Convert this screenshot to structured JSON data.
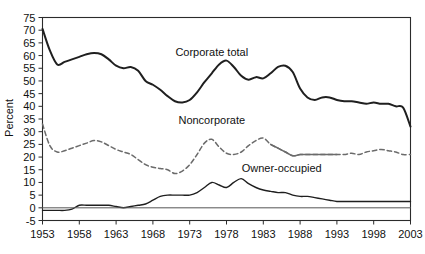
{
  "chart_data": {
    "type": "line",
    "title": "",
    "xlabel": "",
    "ylabel": "Percent",
    "xlim": [
      1953,
      2003
    ],
    "ylim": [
      -5,
      75
    ],
    "ytick_step": 5,
    "xtick_step": 5,
    "grid": false,
    "legend_position": "inline-annotations",
    "xticks": [
      "1953",
      "1958",
      "1963",
      "1968",
      "1973",
      "1978",
      "1983",
      "1988",
      "1993",
      "1998",
      "2003"
    ],
    "yticks": [
      "-5",
      "0",
      "5",
      "10",
      "15",
      "20",
      "25",
      "30",
      "35",
      "40",
      "45",
      "50",
      "55",
      "60",
      "65",
      "70",
      "75"
    ],
    "annotations": [
      {
        "text": "Corporate total",
        "x": 1976.0,
        "y": 60.0
      },
      {
        "text": "Noncorporate",
        "x": 1976.0,
        "y": 33.0
      },
      {
        "text": "Owner-occupied",
        "x": 1985.5,
        "y": 14.0
      }
    ],
    "series": [
      {
        "name": "Corporate total",
        "style": "solid",
        "color": "#1f1f1f",
        "width": 2.0,
        "x": [
          1953,
          1954,
          1955,
          1956,
          1957,
          1958,
          1959,
          1960,
          1961,
          1962,
          1963,
          1964,
          1965,
          1966,
          1967,
          1968,
          1969,
          1970,
          1971,
          1972,
          1973,
          1974,
          1975,
          1976,
          1977,
          1978,
          1979,
          1980,
          1981,
          1982,
          1983,
          1984,
          1985,
          1986,
          1987,
          1988,
          1989,
          1990,
          1991,
          1992,
          1993,
          1994,
          1995,
          1996,
          1997,
          1998,
          1999,
          2000,
          2001,
          2002,
          2003
        ],
        "values": [
          70.5,
          62.0,
          56.5,
          57.5,
          58.5,
          59.5,
          60.5,
          61.0,
          60.5,
          58.5,
          56.0,
          55.0,
          55.5,
          54.0,
          50.0,
          48.5,
          46.5,
          44.0,
          42.0,
          41.5,
          42.5,
          45.5,
          49.5,
          53.0,
          56.5,
          58.0,
          55.5,
          52.0,
          50.5,
          51.5,
          51.0,
          53.0,
          55.5,
          56.0,
          53.5,
          47.0,
          43.5,
          42.5,
          43.5,
          43.5,
          42.5,
          42.0,
          42.0,
          41.5,
          41.0,
          41.5,
          41.0,
          41.0,
          40.0,
          39.5,
          32.0
        ]
      },
      {
        "name": "Noncorporate",
        "style": "dashed",
        "color": "#6b6b6b",
        "width": 1.5,
        "x": [
          1953,
          1954,
          1955,
          1956,
          1957,
          1958,
          1959,
          1960,
          1961,
          1962,
          1963,
          1964,
          1965,
          1966,
          1967,
          1968,
          1969,
          1970,
          1971,
          1972,
          1973,
          1974,
          1975,
          1976,
          1977,
          1978,
          1979,
          1980,
          1981,
          1982,
          1983,
          1984,
          1985,
          1986,
          1987,
          1988,
          1989,
          1990,
          1991,
          1992,
          1993,
          1994,
          1995,
          1996,
          1997,
          1998,
          1999,
          2000,
          2001,
          2002,
          2003
        ],
        "values": [
          33.0,
          24.5,
          22.0,
          22.5,
          23.5,
          24.5,
          25.5,
          26.5,
          26.0,
          24.5,
          23.0,
          22.0,
          21.0,
          19.0,
          17.0,
          16.0,
          15.5,
          15.0,
          13.5,
          14.5,
          17.0,
          21.0,
          25.5,
          27.0,
          24.0,
          21.5,
          21.0,
          22.0,
          24.5,
          26.5,
          27.5,
          25.0,
          23.5,
          22.0,
          20.5,
          21.0,
          21.0,
          21.0,
          21.0,
          21.0,
          21.0,
          21.0,
          21.5,
          21.0,
          22.0,
          22.5,
          23.0,
          22.5,
          22.0,
          21.0,
          21.0
        ]
      },
      {
        "name": "Owner-occupied",
        "style": "solid",
        "color": "#1f1f1f",
        "width": 1.4,
        "x": [
          1953,
          1954,
          1955,
          1956,
          1957,
          1958,
          1959,
          1960,
          1961,
          1962,
          1963,
          1964,
          1965,
          1966,
          1967,
          1968,
          1969,
          1970,
          1971,
          1972,
          1973,
          1974,
          1975,
          1976,
          1977,
          1978,
          1979,
          1980,
          1981,
          1982,
          1983,
          1984,
          1985,
          1986,
          1987,
          1988,
          1989,
          1990,
          1991,
          1992,
          1993,
          1994,
          1995,
          1996,
          1997,
          1998,
          1999,
          2000,
          2001,
          2002,
          2003
        ],
        "values": [
          -1.0,
          -1.0,
          -1.0,
          -1.0,
          -0.5,
          1.0,
          1.0,
          1.0,
          1.0,
          1.0,
          0.5,
          0.0,
          0.5,
          1.0,
          1.5,
          3.0,
          4.5,
          5.0,
          5.0,
          5.0,
          5.0,
          6.0,
          8.0,
          10.0,
          9.0,
          8.0,
          10.0,
          11.5,
          9.5,
          8.0,
          7.0,
          6.5,
          6.0,
          6.0,
          5.0,
          4.5,
          4.5,
          4.0,
          3.5,
          3.0,
          2.5,
          2.5,
          2.5,
          2.5,
          2.5,
          2.5,
          2.5,
          2.5,
          2.5,
          2.5,
          2.5
        ]
      },
      {
        "name": "Zero reference",
        "style": "solid",
        "color": "#555555",
        "width": 1.0,
        "x": [
          1953,
          2003
        ],
        "values": [
          0,
          0
        ]
      }
    ]
  }
}
